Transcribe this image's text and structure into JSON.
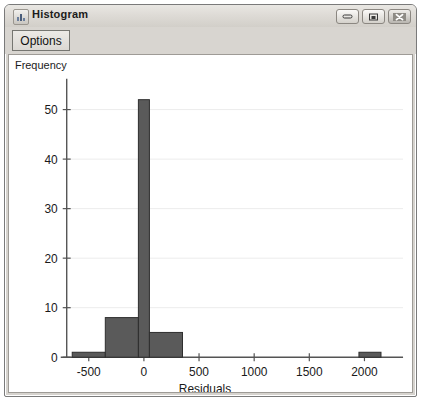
{
  "window": {
    "title": "Histogram",
    "icon": "histogram-app-icon",
    "controls": [
      {
        "name": "minimize",
        "glyph": "minimize-icon"
      },
      {
        "name": "maximize",
        "glyph": "maximize-icon"
      },
      {
        "name": "close",
        "glyph": "close-icon"
      }
    ]
  },
  "toolbar": {
    "options_label": "Options"
  },
  "chart_data": {
    "type": "bar",
    "title": "",
    "subtitle": "",
    "xlabel": "Residuals",
    "ylabel": "Frequency",
    "xlim": [
      -700,
      2350
    ],
    "ylim": [
      0,
      55
    ],
    "grid": true,
    "legend": "none",
    "xticks": [
      -500,
      0,
      500,
      1000,
      1500,
      2000
    ],
    "xtick_labels": [
      "-500",
      "0",
      "500",
      "1000",
      "1500",
      "2000"
    ],
    "yticks": [
      0,
      10,
      20,
      30,
      40,
      50
    ],
    "ytick_labels": [
      "0",
      "10",
      "20",
      "30",
      "40",
      "50"
    ],
    "bin_width": 300,
    "bins": [
      {
        "x0": -650,
        "x1": -350,
        "count": 1
      },
      {
        "x0": -350,
        "x1": -50,
        "count": 8
      },
      {
        "x0": -50,
        "x1": 50,
        "count": 52
      },
      {
        "x0": 50,
        "x1": 350,
        "count": 5
      },
      {
        "x0": 1950,
        "x1": 2150,
        "count": 1
      }
    ],
    "bar_color": "#5a5a5a",
    "bar_edge_color": "#2e2e2e"
  }
}
